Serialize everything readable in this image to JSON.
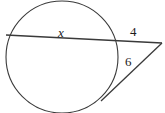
{
  "figure": {
    "kind": "circle-secant-tangent-diagram",
    "background_color": "#ffffff",
    "stroke_color": "#3a3a3a",
    "label_color": "#1c1c1c",
    "circle": {
      "center_x": 62,
      "center_y": 57,
      "radius": 56
    },
    "secant_line": {
      "x1": 6,
      "y1": 35,
      "x2": 162,
      "y2": 43
    },
    "tangent_line": {
      "x1": 101,
      "y1": 101,
      "x2": 162,
      "y2": 43
    },
    "labels": {
      "chord": "x",
      "external_secant": "4",
      "tangent": "6"
    }
  }
}
